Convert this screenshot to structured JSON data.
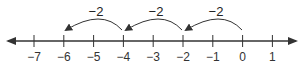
{
  "number_line": {
    "min_label": -7,
    "max_label": 1,
    "ticks": [
      "−7",
      "−6",
      "−5",
      "−4",
      "−3",
      "−2",
      "−1",
      "0",
      "1"
    ],
    "arrows_both_ends": true
  },
  "jumps": [
    {
      "from": 0,
      "to": -2,
      "label": "−2"
    },
    {
      "from": -2,
      "to": -4,
      "label": "−2"
    },
    {
      "from": -4,
      "to": -6,
      "label": "−2"
    }
  ],
  "colors": {
    "line": "#333333",
    "text": "#222222"
  }
}
